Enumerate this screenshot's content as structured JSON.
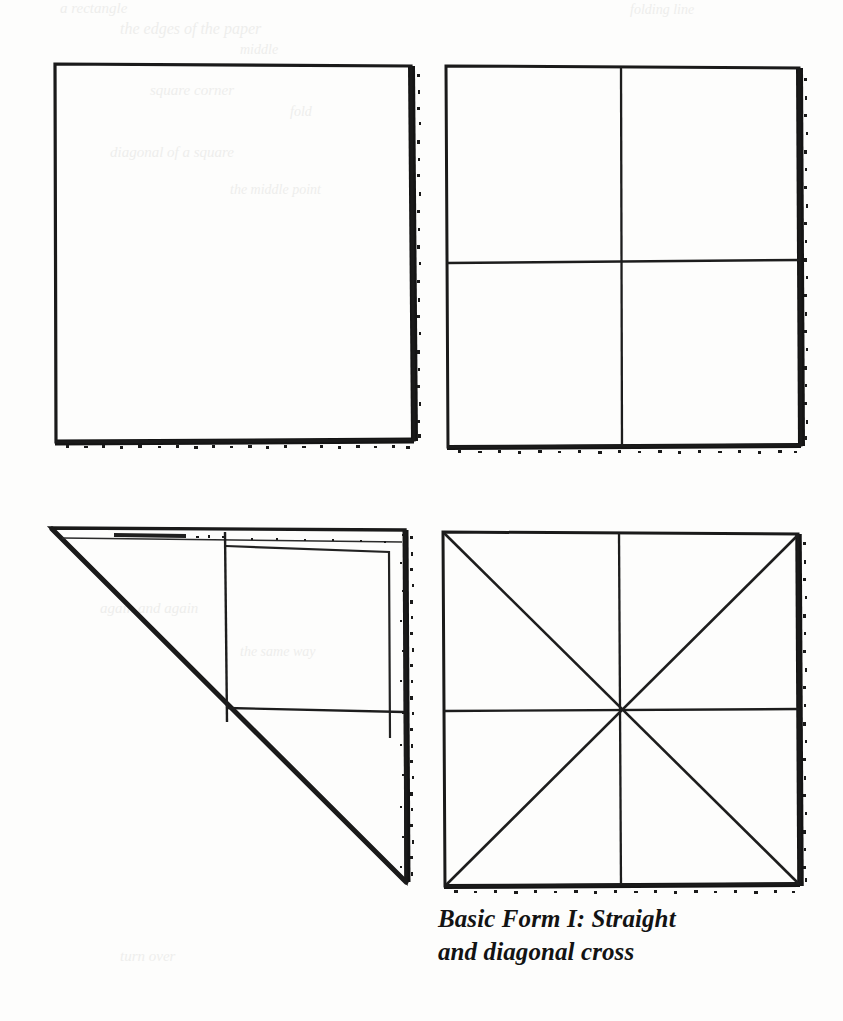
{
  "page": {
    "background_color": "#fdfdfc",
    "ink_color": "#1a1a1a",
    "width": 843,
    "height": 1021
  },
  "caption": {
    "line1": "Basic Form I: Straight",
    "line2": "and diagonal cross",
    "full_text": "Basic Form I: Straight and diagonal cross",
    "style": "bold-italic-serif"
  },
  "figures": [
    {
      "id": "figure-1",
      "name": "plain-square",
      "position": "top-left",
      "description": "Plain empty square, hand-drawn outline with heavy ink shadow on right and bottom edges",
      "creases": [],
      "bounds": {
        "x": 54,
        "y": 63,
        "width": 359,
        "height": 377
      }
    },
    {
      "id": "figure-2",
      "name": "square-with-straight-cross",
      "position": "top-right",
      "description": "Square divided by one vertical and one horizontal centre crease into four quadrants",
      "creases": [
        "vertical-centre",
        "horizontal-centre"
      ],
      "bounds": {
        "x": 445,
        "y": 66,
        "width": 355,
        "height": 379
      }
    },
    {
      "id": "figure-3",
      "name": "square-folded-on-diagonal",
      "position": "bottom-left",
      "description": "Square folded along the diagonal from top-left to bottom-right, forming a triangle; straight cross creases remain visible in the lower layer",
      "creases": [
        "diagonal-fold",
        "vertical-centre",
        "horizontal-centre"
      ],
      "bounds": {
        "x": 50,
        "y": 528,
        "width": 355,
        "height": 352
      }
    },
    {
      "id": "figure-4",
      "name": "square-with-straight-and-diagonal-cross",
      "position": "bottom-right",
      "description": "Square with both straight cross and both diagonals, eight creases radiating from the centre",
      "creases": [
        "vertical-centre",
        "horizontal-centre",
        "diagonal-tl-br",
        "diagonal-tr-bl"
      ],
      "bounds": {
        "x": 442,
        "y": 532,
        "width": 358,
        "height": 353
      }
    }
  ],
  "ghosts": [
    {
      "text": "a rectangle",
      "x": 60,
      "y": 2,
      "size": 15
    },
    {
      "text": "folding line",
      "x": 430,
      "y": 4,
      "size": 14
    },
    {
      "text": "the edges of the paper",
      "x": 120,
      "y": 24,
      "size": 16
    },
    {
      "text": "middle",
      "x": 240,
      "y": 44,
      "size": 14
    },
    {
      "text": "square corner",
      "x": 150,
      "y": 84,
      "size": 15
    },
    {
      "text": "fold",
      "x": 290,
      "y": 106,
      "size": 14
    },
    {
      "text": "diagonal of a square",
      "x": 110,
      "y": 146,
      "size": 15
    },
    {
      "text": "the middle point",
      "x": 230,
      "y": 184,
      "size": 14
    },
    {
      "text": "again and again",
      "x": 100,
      "y": 602,
      "size": 15
    },
    {
      "text": "the same way",
      "x": 240,
      "y": 646,
      "size": 14
    },
    {
      "text": "turn over",
      "x": 120,
      "y": 950,
      "size": 15
    }
  ]
}
